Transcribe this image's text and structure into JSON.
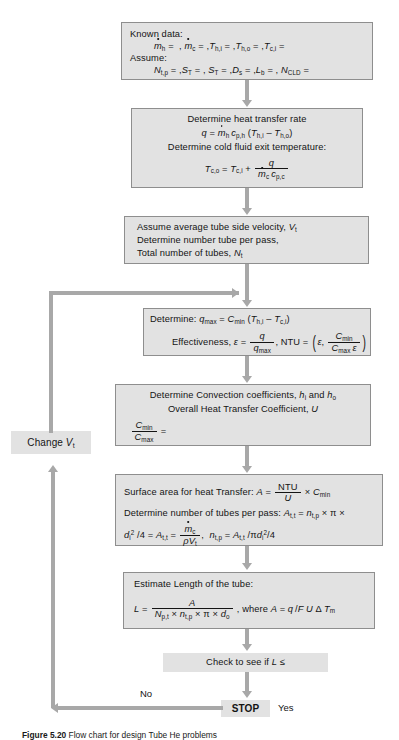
{
  "figure": {
    "type": "flowchart",
    "title": "Flow chart for design Tube He problems",
    "caption_label": "Figure 5.20",
    "caption_text": "Flow chart for design Tube He problems"
  },
  "palette": {
    "box_fill": "#e2e2e2",
    "box_border": "#8e8e8e",
    "connector": "#a8a8a8",
    "text": "#141414",
    "page_bg": "#ffffff"
  },
  "nodes": {
    "known_data": {
      "id": "known-data",
      "shape": "process",
      "lines": [
        "Known data:",
        "mh = , mc = , Th,i = , Th,o = , Tc,i =",
        "Assume:",
        "Nt,p = , ST = , ST = , Ds = , Lb = , NCLD ="
      ]
    },
    "heat_transfer_rate": {
      "id": "heat-transfer-rate",
      "shape": "process",
      "lines": [
        "Determine heat transfer rate",
        "q = mh cp,h (Th,i - Th,o)",
        "Determine cold fluid exit temperature:",
        "Tc,o = Tc,i + q / (mc cp,c)"
      ]
    },
    "assume_velocity": {
      "id": "assume-velocity",
      "shape": "process",
      "lines": [
        "Assume average tube side velocity, Vt",
        "Determine number tube per pass,",
        "Total number of tubes, Nt"
      ]
    },
    "determine_qmax": {
      "id": "determine-qmax",
      "shape": "process",
      "lines": [
        "Determine: qmax = Cmin (Th,i - Tc,i)",
        "Effectiveness, e = q / qmax , NTU = ( e , Cmin / (Cmax e) )"
      ]
    },
    "convection_coefficients": {
      "id": "convection-coefficients",
      "shape": "process",
      "lines": [
        "Determine Convection coefficients, hi and ho",
        "Overall Heat Transfer Coefficient, U",
        "Cmin / Cmax ="
      ]
    },
    "surface_area": {
      "id": "surface-area",
      "shape": "process",
      "lines": [
        "Surface area for heat Transfer: A = NTU / U x Cmin",
        "Determine number of tubes per pass: At,t = nt,p x pi x",
        "di^2 /4 = At,t = mc / (rho Vt) ,  nt,p = At,t / pi di^2 /4"
      ]
    },
    "estimate_length": {
      "id": "estimate-length",
      "shape": "process",
      "lines": [
        "Estimate Length of the tube:",
        "L = A / (Np,t x nt,p x pi x do) , where A = q / F U dT m"
      ]
    },
    "check_length": {
      "id": "check-length",
      "shape": "decision-text",
      "lines": [
        "Check to see if L ≤"
      ]
    },
    "change_vt": {
      "id": "change-vt",
      "shape": "process",
      "lines": [
        "Change Vt"
      ]
    },
    "stop": {
      "id": "stop",
      "shape": "terminator",
      "lines": [
        "STOP"
      ]
    }
  },
  "edge_labels": {
    "no": "No",
    "yes": "Yes"
  }
}
